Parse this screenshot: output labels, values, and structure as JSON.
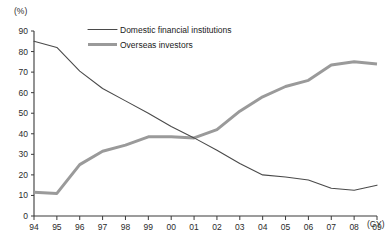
{
  "chart_data": {
    "type": "line",
    "title": "",
    "subtitle": "",
    "xlabel": "(CY)",
    "ylabel": "(%)",
    "x": [
      "94",
      "95",
      "96",
      "97",
      "98",
      "99",
      "00",
      "01",
      "02",
      "03",
      "04",
      "05",
      "06",
      "07",
      "08",
      "09"
    ],
    "categories": [
      "94",
      "95",
      "96",
      "97",
      "98",
      "99",
      "00",
      "01",
      "02",
      "03",
      "04",
      "05",
      "06",
      "07",
      "08",
      "09"
    ],
    "series": [
      {
        "name": "Domestic financial institutions",
        "color": "#4a4a4a",
        "line_width": 1.1,
        "values": [
          85.0,
          82.0,
          70.5,
          62.0,
          56.0,
          50.0,
          43.5,
          38.0,
          32.0,
          25.5,
          20.0,
          19.0,
          17.5,
          13.5,
          12.5,
          15.0
        ]
      },
      {
        "name": "Overseas investors",
        "color": "#9a9a9a",
        "line_width": 3.0,
        "values": [
          11.5,
          11.0,
          25.0,
          31.5,
          34.5,
          38.5,
          38.5,
          38.0,
          42.0,
          51.0,
          58.0,
          63.0,
          66.0,
          73.5,
          75.0,
          74.0
        ]
      }
    ],
    "yticks": [
      0,
      10,
      20,
      30,
      40,
      50,
      60,
      70,
      80,
      90
    ],
    "ylim": [
      0,
      90
    ],
    "xlim": [
      "94",
      "09"
    ],
    "grid": false,
    "legend_position": "inside-top-center",
    "legend": [
      "Domestic financial institutions",
      "Overseas investors"
    ]
  },
  "axes": {
    "y_unit_label": "(%)",
    "x_unit_label": "(CY)"
  },
  "footer": {
    "source_note": ""
  }
}
